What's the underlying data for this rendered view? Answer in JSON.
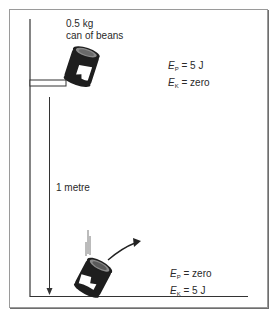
{
  "diagram": {
    "type": "energy-transfer-illustration",
    "object_label": [
      "0.5 kg",
      "can of beans"
    ],
    "height_label": "1 metre",
    "top_state": {
      "ep": {
        "symbol": "E",
        "sub": "P",
        "value": "= 5 J"
      },
      "ek": {
        "symbol": "E",
        "sub": "K",
        "value": "= zero"
      }
    },
    "bottom_state": {
      "ep": {
        "symbol": "E",
        "sub": "P",
        "value": "= zero"
      },
      "ek": {
        "symbol": "E",
        "sub": "K",
        "value": "= 5 J"
      }
    },
    "colors": {
      "line": "#333333",
      "can_body": "#1e1e1e",
      "can_lid": "#8a8a8a",
      "frame": "#9a9a9a"
    }
  }
}
